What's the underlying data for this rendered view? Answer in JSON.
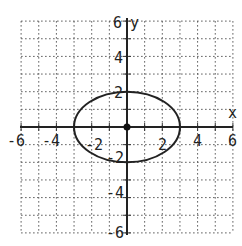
{
  "chart_data": {
    "type": "line",
    "title": "",
    "xlabel": "x",
    "ylabel": "y",
    "xlim": [
      -6,
      6
    ],
    "ylim": [
      -6,
      6
    ],
    "grid": true,
    "grid_style": "dotted",
    "grid_step": 1,
    "x_ticks": [
      "-6",
      "-4",
      "-2",
      "2",
      "4",
      "6"
    ],
    "y_ticks": [
      "6",
      "4",
      "2",
      "-2",
      "-4",
      "-6"
    ],
    "series": [
      {
        "name": "ellipse",
        "equation": "x^2/9 + y^2/4 = 1",
        "center": [
          0,
          0
        ],
        "semi_axis_x": 3,
        "semi_axis_y": 2,
        "vertices": [
          [
            -3,
            0
          ],
          [
            3,
            0
          ],
          [
            0,
            2
          ],
          [
            0,
            -2
          ]
        ]
      }
    ],
    "points": [
      {
        "label": "center",
        "x": 0,
        "y": 0
      }
    ]
  },
  "axes": {
    "x_label": "x",
    "y_label": "y"
  },
  "ticks": {
    "x": [
      "-6",
      "-4",
      "-2",
      "2",
      "4",
      "6"
    ],
    "y_top": "6",
    "y_4": "4",
    "y_2": "2",
    "y_m2": "-2",
    "y_m4": "-4",
    "y_m6": "-6"
  }
}
